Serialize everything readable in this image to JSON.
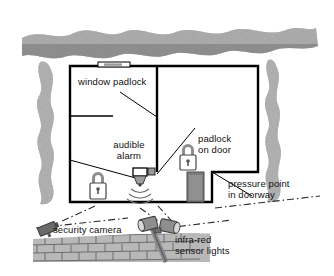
{
  "diagram": {
    "type": "annotated-illustration",
    "palette": {
      "ink": "#111111",
      "wall": "#000000",
      "hedge_dark": "#6f6f6f",
      "hedge_mid": "#9a9a9a",
      "hedge_light": "#c9c9c9",
      "brick_face": "#b0b0b0",
      "brick_line": "#6d6d6d",
      "device_gray": "#8a8a8a",
      "door_gray": "#7d7d7d",
      "background": "#ffffff"
    }
  },
  "labels": [
    {
      "id": "window-padlock",
      "text": "window padlock",
      "x": 78,
      "y": 76,
      "align": "left"
    },
    {
      "id": "audible-alarm",
      "text": "audible\nalarm",
      "x": 103,
      "y": 139,
      "align": "center"
    },
    {
      "id": "padlock-on-door",
      "text": "padlock\non door",
      "x": 198,
      "y": 133,
      "align": "left"
    },
    {
      "id": "pressure-point",
      "text": "pressure point\nin doorway",
      "x": 228,
      "y": 178,
      "align": "left"
    },
    {
      "id": "security-camera",
      "text": "security camera",
      "x": 53,
      "y": 224,
      "align": "left"
    },
    {
      "id": "infra-red-lights",
      "text": "infra-red\nsensor lights",
      "x": 175,
      "y": 234,
      "align": "left"
    }
  ],
  "features": [
    {
      "id": "window-padlock",
      "name": "window padlock",
      "icon": "padlock-icon",
      "location": "upper wall window"
    },
    {
      "id": "audible-alarm",
      "name": "audible alarm",
      "icon": "alarm-siren-icon",
      "location": "interior wall"
    },
    {
      "id": "padlock-on-door",
      "name": "padlock on door",
      "icon": "padlock-icon",
      "location": "door"
    },
    {
      "id": "pressure-point",
      "name": "pressure point in doorway",
      "icon": "pressure-mat-icon",
      "location": "doorway"
    },
    {
      "id": "security-camera",
      "name": "security camera",
      "icon": "cctv-camera-icon",
      "location": "garden wall"
    },
    {
      "id": "infra-red-lights",
      "name": "infra-red sensor lights",
      "icon": "floodlight-icon",
      "location": "garden wall"
    },
    {
      "id": "door-padlock-left",
      "name": "padlock",
      "icon": "padlock-icon",
      "location": "lower left room"
    }
  ],
  "structure": {
    "house_outline": "M70,66 L258,66 L258,172 L212,172 L212,202 L70,202 Z",
    "interior_wall_vertical_x": 157,
    "interior_wall_horizontal_y": 116,
    "hedges": [
      "top-hedge-band",
      "left-hedge",
      "right-hedge"
    ],
    "garden_wall": "brick-wall"
  }
}
